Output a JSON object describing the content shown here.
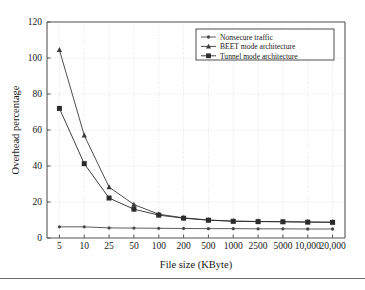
{
  "figure": {
    "name": "overhead-percentage-vs-file-size-chart"
  },
  "chart_data": {
    "type": "line",
    "title": "",
    "xlabel": "File size (KByte)",
    "ylabel": "Overhead percentage",
    "categories": [
      "5",
      "10",
      "25",
      "50",
      "100",
      "200",
      "500",
      "1000",
      "2500",
      "5000",
      "10,000",
      "20,000"
    ],
    "x_tick_labels": [
      "5",
      "10",
      "25",
      "50",
      "100",
      "200",
      "500",
      "1000",
      "2500",
      "5000",
      "10,000",
      "20,000"
    ],
    "y_tick_labels": [
      "0",
      "20",
      "40",
      "60",
      "80",
      "100",
      "120"
    ],
    "y_ticks": [
      0,
      20,
      40,
      60,
      80,
      100,
      120
    ],
    "ylim": [
      0,
      120
    ],
    "grid": true,
    "legend_position": "top-right",
    "series": [
      {
        "name": "Nonsecure traffic",
        "marker": "circle",
        "color": "#4a4a4a",
        "values": [
          6.2,
          6.2,
          5.6,
          5.5,
          5.4,
          5.3,
          5.2,
          5.2,
          5.1,
          5.1,
          5.0,
          5.0
        ]
      },
      {
        "name": "BEET mode architecture",
        "marker": "triangle",
        "color": "#3a3a3a",
        "values": [
          104.5,
          57.0,
          28.3,
          18.6,
          13.2,
          11.2,
          10.0,
          9.4,
          9.2,
          9.1,
          8.9,
          8.8
        ]
      },
      {
        "name": "Tunnel mode architecture",
        "marker": "square",
        "color": "#2b2b2b",
        "values": [
          72.0,
          41.3,
          22.2,
          16.0,
          12.7,
          11.0,
          9.9,
          9.3,
          9.1,
          9.0,
          8.8,
          8.7
        ]
      }
    ]
  },
  "legend": {
    "items": [
      {
        "label": "Nonsecure traffic",
        "marker": "circle-marker-icon"
      },
      {
        "label": "BEET mode architecture",
        "marker": "triangle-marker-icon"
      },
      {
        "label": "Tunnel mode architecture",
        "marker": "square-marker-icon"
      }
    ]
  },
  "colors": {
    "axis": "#555555",
    "grid": "#d8d8d8",
    "background": "#ffffff",
    "rule": "#6b6b6b"
  }
}
